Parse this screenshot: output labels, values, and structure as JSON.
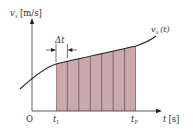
{
  "diagram": {
    "y_axis": {
      "label_var": "v",
      "label_sub": "x",
      "label_unit": "[m/s]"
    },
    "x_axis": {
      "label_var": "t",
      "label_unit": "[s]"
    },
    "origin_label": "O",
    "curve_label": {
      "var": "v",
      "sub": "x",
      "arg": "(t)"
    },
    "interval_start": {
      "var": "t",
      "sub": "I"
    },
    "interval_end": {
      "var": "t",
      "sub": "F"
    },
    "step_label": "Δt",
    "num_bars": 7,
    "colors": {
      "bar_fill": "#c9a9ac",
      "bar_edge": "#6e4e55",
      "curve": "#222222",
      "axis": "#333333"
    }
  }
}
